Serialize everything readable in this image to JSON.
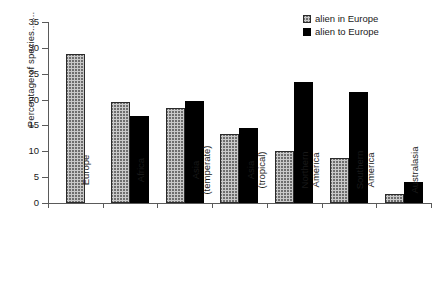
{
  "chart_data": {
    "type": "bar",
    "title": "",
    "xlabel": "",
    "ylabel": "Percentage of species.......",
    "ylim": [
      0,
      35
    ],
    "ytick_values": [
      0,
      5,
      10,
      15,
      20,
      25,
      30,
      35
    ],
    "ytick_labels": [
      "0",
      "5",
      "10",
      "15",
      "20",
      "25",
      "30",
      "35"
    ],
    "grid": false,
    "legend_position": "top-right",
    "categories": [
      "Europe",
      "Africa",
      "Asia\n(temperate)",
      "Asia\n(tropical)",
      "Northern\nAmerica",
      "Southern\nAmerica",
      "Australasia"
    ],
    "series": [
      {
        "name": "alien in Europe",
        "style": "hatched",
        "color": "#c9c9c9",
        "values": [
          28.8,
          19.5,
          18.3,
          13.3,
          10.0,
          8.8,
          1.7
        ]
      },
      {
        "name": "alien to Europe",
        "style": "solid",
        "color": "#000000",
        "values": [
          null,
          16.8,
          19.8,
          14.5,
          23.4,
          21.5,
          4.0
        ]
      }
    ]
  },
  "legend": {
    "items": [
      {
        "label": "alien in Europe"
      },
      {
        "label": "alien to Europe"
      }
    ]
  }
}
